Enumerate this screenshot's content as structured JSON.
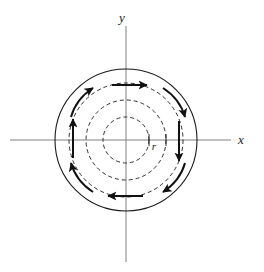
{
  "figure": {
    "kind": "vector-field-diagram",
    "background_color": "#ffffff",
    "width": 264,
    "height": 272
  },
  "axes": {
    "color": "#808080",
    "stroke_width": 1,
    "origin": {
      "x": 126,
      "y": 140
    },
    "x_axis": {
      "label": "x",
      "label_position": {
        "x": 241,
        "y": 144
      },
      "start": {
        "x": 10,
        "y": 140
      },
      "end": {
        "x": 231,
        "y": 140
      }
    },
    "y_axis": {
      "label": "y",
      "label_position": {
        "x": 122,
        "y": 22
      },
      "start": {
        "x": 126,
        "y": 26
      },
      "end": {
        "x": 126,
        "y": 262
      }
    }
  },
  "circles": {
    "stroke_color": "#1a1a1a",
    "items": [
      {
        "name": "outer-solid-circle",
        "radius": 71,
        "style": "solid",
        "stroke_width": 1.1,
        "dash": ""
      },
      {
        "name": "dashed-circle-1",
        "radius": 57,
        "style": "dashed",
        "stroke_width": 0.9,
        "dash": "4 3"
      },
      {
        "name": "dashed-circle-2",
        "radius": 40,
        "style": "dashed",
        "stroke_width": 0.9,
        "dash": "4 3"
      },
      {
        "name": "dashed-circle-3",
        "radius": 23,
        "style": "dashed",
        "stroke_width": 0.9,
        "dash": "4 3"
      }
    ]
  },
  "radius_marker": {
    "label": "r",
    "label_position": {
      "x": 154,
      "y": 150
    },
    "tick_positions_on_x_axis": [
      149,
      166
    ]
  },
  "field_arrows": {
    "direction": "counterclockwise",
    "color": "#111111",
    "stroke_width": 2,
    "count": 8,
    "items": [
      {
        "name": "arrow-top-straight",
        "type": "straight",
        "x1": 112,
        "y1": 85,
        "x2": 147,
        "y2": 85
      },
      {
        "name": "arrow-left-straight",
        "type": "straight",
        "x1": 73,
        "y1": 158,
        "x2": 73,
        "y2": 119
      },
      {
        "name": "arrow-right-straight",
        "type": "straight",
        "x1": 179,
        "y1": 121,
        "x2": 179,
        "y2": 161
      },
      {
        "name": "arrow-bottom-straight",
        "type": "straight",
        "x1": 143,
        "y1": 196,
        "x2": 108,
        "y2": 196
      },
      {
        "name": "arrow-upper-left-curved",
        "type": "curved",
        "path": "M 71 117 Q 76 99 93 88"
      },
      {
        "name": "arrow-upper-right-curved",
        "type": "curved",
        "path": "M 163 88 Q 180 99 185 117"
      },
      {
        "name": "arrow-lower-right-curved",
        "type": "curved",
        "path": "M 185 163 Q 180 181 163 192"
      },
      {
        "name": "arrow-lower-left-curved",
        "type": "curved",
        "path": "M 93 192 Q 76 181 71 163"
      }
    ]
  }
}
